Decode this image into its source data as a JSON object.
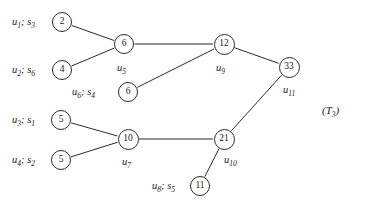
{
  "figure": {
    "caption": "(T3)",
    "caption_plain": "(T_3)",
    "background": "#ffffff",
    "stroke_color": "#2b2b2b",
    "text_color": "#1a1a1a"
  },
  "nodes": [
    {
      "id": "n2",
      "value": "2",
      "cx": 62,
      "cy": 22,
      "r": 10
    },
    {
      "id": "n4",
      "value": "4",
      "cx": 62,
      "cy": 70,
      "r": 10
    },
    {
      "id": "n6a",
      "value": "6",
      "cx": 124,
      "cy": 44,
      "r": 10
    },
    {
      "id": "n6b",
      "value": "6",
      "cx": 128,
      "cy": 92,
      "r": 10
    },
    {
      "id": "n12",
      "value": "12",
      "cx": 224,
      "cy": 44,
      "r": 10.5
    },
    {
      "id": "n33",
      "value": "33",
      "cx": 289,
      "cy": 67,
      "r": 10.5
    },
    {
      "id": "n5a",
      "value": "5",
      "cx": 61,
      "cy": 120,
      "r": 10
    },
    {
      "id": "n5b",
      "value": "5",
      "cx": 61,
      "cy": 160,
      "r": 10
    },
    {
      "id": "n10",
      "value": "10",
      "cx": 128,
      "cy": 139,
      "r": 10.5
    },
    {
      "id": "n21",
      "value": "21",
      "cx": 224,
      "cy": 139,
      "r": 10.5
    },
    {
      "id": "n11",
      "value": "11",
      "cx": 200,
      "cy": 186,
      "r": 10
    }
  ],
  "edges": [
    {
      "from": "n2",
      "to": "n6a"
    },
    {
      "from": "n4",
      "to": "n6a"
    },
    {
      "from": "n6a",
      "to": "n12"
    },
    {
      "from": "n6b",
      "to": "n12"
    },
    {
      "from": "n12",
      "to": "n33"
    },
    {
      "from": "n33",
      "to": "n21"
    },
    {
      "from": "n5a",
      "to": "n10"
    },
    {
      "from": "n5b",
      "to": "n10"
    },
    {
      "from": "n10",
      "to": "n21"
    },
    {
      "from": "n11",
      "to": "n21"
    }
  ],
  "side_labels": [
    {
      "id": "lbl_u1",
      "text": "u1; s3",
      "html": "<i>u</i><sub>1</sub>; <i>s</i><sub>3</sub>",
      "x": 12,
      "y": 17
    },
    {
      "id": "lbl_u2",
      "text": "u2; s6",
      "html": "<i>u</i><sub>2</sub>; <i>s</i><sub>6</sub>",
      "x": 12,
      "y": 65
    },
    {
      "id": "lbl_u6",
      "text": "u6; s4",
      "html": "<i>u</i><sub>6</sub>; <i>s</i><sub>4</sub>",
      "x": 72,
      "y": 87
    },
    {
      "id": "lbl_u3",
      "text": "u3; s1",
      "html": "<i>u</i><sub>3</sub>; <i>s</i><sub>1</sub>",
      "x": 12,
      "y": 115
    },
    {
      "id": "lbl_u4",
      "text": "u4; s2",
      "html": "<i>u</i><sub>4</sub>; <i>s</i><sub>2</sub>",
      "x": 12,
      "y": 155
    },
    {
      "id": "lbl_u8",
      "text": "u8; s5",
      "html": "<i>u</i><sub>8</sub>; <i>s</i><sub>5</sub>",
      "x": 152,
      "y": 181
    }
  ],
  "edge_labels": [
    {
      "id": "lbl_u5",
      "text": "u5",
      "html": "<i>u</i><sub>5</sub>",
      "x": 117,
      "y": 63
    },
    {
      "id": "lbl_u9",
      "text": "u9",
      "html": "<i>u</i><sub>9</sub>",
      "x": 216,
      "y": 63
    },
    {
      "id": "lbl_u11",
      "text": "u11",
      "html": "<i>u</i><sub>11</sub>",
      "x": 283,
      "y": 85
    },
    {
      "id": "lbl_u7",
      "text": "u7",
      "html": "<i>u</i><sub>7</sub>",
      "x": 122,
      "y": 157
    },
    {
      "id": "lbl_u10",
      "text": "u10",
      "html": "<i>u</i><sub>10</sub>",
      "x": 224,
      "y": 155
    }
  ],
  "caption_label": {
    "id": "lbl_T3",
    "text": "(T3)",
    "html": "(<i>T</i><sub>3</sub>)",
    "x": 322,
    "y": 105
  }
}
